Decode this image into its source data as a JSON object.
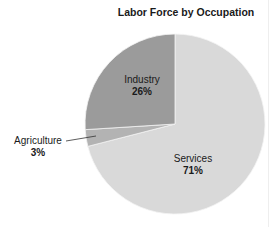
{
  "chart_data": {
    "type": "pie",
    "title": "Labor Force by Occupation",
    "categories": [
      "Services",
      "Agriculture",
      "Industry"
    ],
    "values": [
      71,
      3,
      26
    ],
    "labels": [
      "71%",
      "3%",
      "26%"
    ],
    "colors": [
      "#d9d9d9",
      "#b3b3b3",
      "#9b9b9b"
    ],
    "start_angle_deg": 0,
    "direction": "clockwise",
    "legend": "none (direct labels)",
    "annotations": [
      {
        "text": "Agriculture",
        "leader_line": true
      }
    ]
  },
  "labels": {
    "services": {
      "name": "Services",
      "pct": "71%"
    },
    "agriculture": {
      "name": "Agriculture",
      "pct": "3%"
    },
    "industry": {
      "name": "Industry",
      "pct": "26%"
    }
  }
}
